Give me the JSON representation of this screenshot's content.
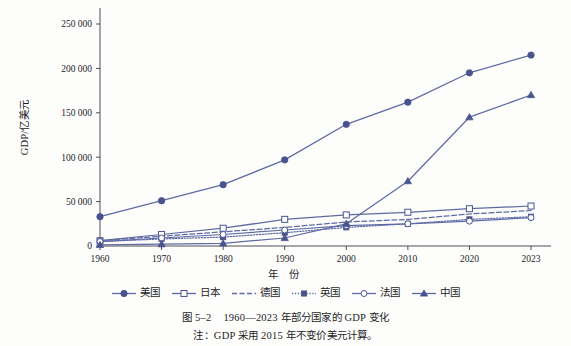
{
  "figure": {
    "caption_number": "图 5–2",
    "caption_text": "1960—2023 年部分国家的 GDP 变化",
    "note": "注：GDP 采用 2015 年不变价美元计算。"
  },
  "axes": {
    "ylabel": "GDP/亿美元",
    "xlabel": "年 份",
    "ytick_labels": [
      "0",
      "50 000",
      "100 000",
      "150 000",
      "200 000",
      "250 000"
    ],
    "xtick_labels": [
      "1960",
      "1970",
      "1980",
      "1990",
      "2000",
      "2010",
      "2020",
      "2023"
    ]
  },
  "colors": {
    "line": "#5f6aa3",
    "line_dark": "#4a5591",
    "marker_fill": "#49538d",
    "marker_open": "#ffffff",
    "axis": "#3b3b45",
    "text": "#1d1d1f",
    "background": "#fdfdfc"
  },
  "chart_data": {
    "type": "line",
    "title": "1960—2023 年部分国家的 GDP 变化",
    "xlabel": "年 份",
    "ylabel": "GDP/亿美元",
    "note": "注：GDP 采用 2015 年不变价美元计算。",
    "x": [
      1960,
      1970,
      1980,
      1990,
      2000,
      2010,
      2020,
      2023
    ],
    "categories": [
      "1960",
      "1970",
      "1980",
      "1990",
      "2000",
      "2010",
      "2020",
      "2023"
    ],
    "ylim": [
      0,
      250000
    ],
    "ytick_values": [
      0,
      50000,
      100000,
      150000,
      200000,
      250000
    ],
    "grid": false,
    "legend_position": "bottom",
    "series": [
      {
        "name": "美国",
        "marker": "filled-circle",
        "dash": "solid",
        "values": [
          33000,
          51000,
          69000,
          97000,
          137000,
          162000,
          195000,
          215000
        ]
      },
      {
        "name": "日本",
        "marker": "open-square",
        "dash": "solid",
        "values": [
          6000,
          13000,
          20000,
          30000,
          35000,
          38000,
          42000,
          45000
        ]
      },
      {
        "name": "德国",
        "marker": "none",
        "dash": "dashed",
        "values": [
          6000,
          11000,
          16000,
          21000,
          27000,
          30000,
          36000,
          40000
        ]
      },
      {
        "name": "英国",
        "marker": "filled-square",
        "dash": "dotted",
        "values": [
          5000,
          8000,
          10000,
          15000,
          21000,
          25000,
          30000,
          33000
        ]
      },
      {
        "name": "法国",
        "marker": "open-circle",
        "dash": "solid",
        "values": [
          5000,
          9000,
          13000,
          18000,
          23000,
          25000,
          28000,
          32000
        ]
      },
      {
        "name": "中国",
        "marker": "filled-triangle",
        "dash": "solid",
        "values": [
          1200,
          2000,
          3000,
          9000,
          25000,
          73000,
          145000,
          170000
        ]
      }
    ]
  }
}
